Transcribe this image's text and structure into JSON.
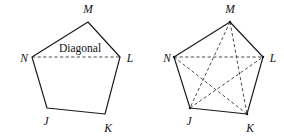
{
  "figure": {
    "background_color": "#ffffff",
    "line_color": "#1a1a1a",
    "dashed_line_color": "#2b2b2b",
    "width": 284,
    "height": 139
  },
  "diagrams": [
    {
      "id": "left-pentagon",
      "name": "pentagon-single-diagonal",
      "caption": "Diagonal",
      "caption_position": {
        "x": 80,
        "y": 52
      },
      "vertices": [
        {
          "name": "M",
          "label": "M",
          "x": 88,
          "y": 22,
          "label_x": 88,
          "label_y": 13
        },
        {
          "name": "L",
          "label": "L",
          "x": 120,
          "y": 57,
          "label_x": 130,
          "label_y": 62
        },
        {
          "name": "K",
          "label": "K",
          "x": 105,
          "y": 114,
          "label_x": 108,
          "label_y": 132
        },
        {
          "name": "J",
          "label": "J",
          "x": 47,
          "y": 108,
          "label_x": 46,
          "label_y": 125
        },
        {
          "name": "N",
          "label": "N",
          "x": 32,
          "y": 57,
          "label_x": 24,
          "label_y": 62
        }
      ],
      "sides": [
        [
          "M",
          "L"
        ],
        [
          "L",
          "K"
        ],
        [
          "K",
          "J"
        ],
        [
          "J",
          "N"
        ],
        [
          "N",
          "M"
        ]
      ],
      "diagonals": [
        [
          "N",
          "L"
        ]
      ]
    },
    {
      "id": "right-pentagon",
      "name": "pentagon-all-diagonals",
      "caption": "",
      "vertices": [
        {
          "name": "M",
          "label": "M",
          "x": 230,
          "y": 22,
          "label_x": 230,
          "label_y": 13
        },
        {
          "name": "L",
          "label": "L",
          "x": 263,
          "y": 57,
          "label_x": 273,
          "label_y": 62
        },
        {
          "name": "K",
          "label": "K",
          "x": 247,
          "y": 114,
          "label_x": 250,
          "label_y": 132
        },
        {
          "name": "J",
          "label": "J",
          "x": 190,
          "y": 108,
          "label_x": 189,
          "label_y": 125
        },
        {
          "name": "N",
          "label": "N",
          "x": 174,
          "y": 57,
          "label_x": 167,
          "label_y": 62
        }
      ],
      "sides": [
        [
          "M",
          "L"
        ],
        [
          "L",
          "K"
        ],
        [
          "K",
          "J"
        ],
        [
          "J",
          "N"
        ],
        [
          "N",
          "M"
        ]
      ],
      "diagonals": [
        [
          "N",
          "L"
        ],
        [
          "M",
          "J"
        ],
        [
          "M",
          "K"
        ],
        [
          "N",
          "K"
        ],
        [
          "J",
          "L"
        ]
      ]
    }
  ]
}
